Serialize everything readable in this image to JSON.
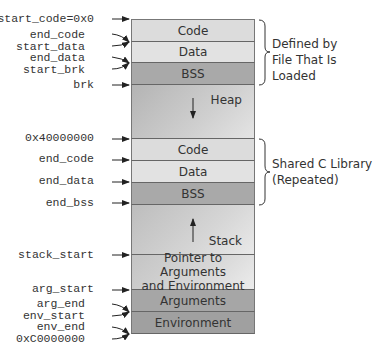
{
  "diagram": {
    "segments": [
      {
        "id": "code1",
        "label": "Code"
      },
      {
        "id": "data1",
        "label": "Data"
      },
      {
        "id": "bss1",
        "label": "BSS"
      },
      {
        "id": "heap",
        "label": "Heap",
        "arrow": "down"
      },
      {
        "id": "code2",
        "label": "Code"
      },
      {
        "id": "data2",
        "label": "Data"
      },
      {
        "id": "bss2",
        "label": "BSS"
      },
      {
        "id": "stack",
        "label": "Stack",
        "arrow": "up"
      },
      {
        "id": "pointer",
        "label_line1": "Pointer to Arguments",
        "label_line2": "and Environment"
      },
      {
        "id": "arguments",
        "label": "Arguments"
      },
      {
        "id": "environment",
        "label": "Environment"
      }
    ],
    "address_labels": [
      "start_code=0x0",
      "end_code",
      "start_data",
      "end_data",
      "start_brk",
      "brk",
      "0x40000000",
      "end_code",
      "end_data",
      "end_bss",
      "stack_start",
      "arg_start",
      "arg_end",
      "env_start",
      "env_end",
      "0xC0000000"
    ],
    "braces": [
      {
        "line1": "Defined by",
        "line2": "File That Is Loaded"
      },
      {
        "line1": "Shared C Library",
        "line2": "(Repeated)"
      }
    ]
  }
}
